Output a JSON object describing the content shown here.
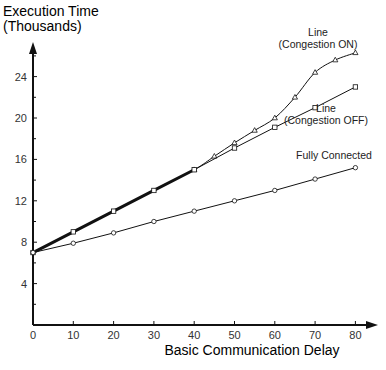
{
  "chart_data": {
    "type": "line",
    "title": "",
    "ylabel_line1": "Execution Time",
    "ylabel_line2": "(Thousands)",
    "xlabel": "Basic Communication Delay",
    "xlim": [
      0,
      80
    ],
    "ylim": [
      0,
      27
    ],
    "xticks": [
      0,
      10,
      20,
      30,
      40,
      50,
      60,
      70,
      80
    ],
    "yticks": [
      4,
      8,
      12,
      16,
      20,
      24
    ],
    "yticks_minor": [
      2,
      6,
      10,
      14,
      18,
      22,
      26
    ],
    "grid": false,
    "series": [
      {
        "name": "Line (Congestion ON)",
        "label_line1": "Line",
        "label_line2": "(Congestion ON)",
        "marker": "triangle",
        "x": [
          0,
          10,
          20,
          30,
          40,
          45,
          50,
          55,
          60,
          65,
          70,
          75,
          80
        ],
        "y": [
          7.0,
          9.0,
          11.0,
          13.0,
          15.0,
          16.3,
          17.6,
          18.8,
          20.0,
          22.0,
          24.4,
          25.6,
          26.3
        ]
      },
      {
        "name": "Line (Congestion OFF)",
        "label_line1": "Line",
        "label_line2": "(Congestion OFF)",
        "marker": "square",
        "x": [
          0,
          10,
          20,
          30,
          40,
          50,
          60,
          70,
          80
        ],
        "y": [
          7.0,
          9.0,
          11.0,
          13.0,
          15.0,
          17.1,
          19.1,
          21.0,
          23.0
        ]
      },
      {
        "name": "Fully Connected",
        "label_line1": "Fully Connected",
        "marker": "circle",
        "x": [
          0,
          10,
          20,
          30,
          40,
          50,
          60,
          70,
          80
        ],
        "y": [
          7.0,
          7.9,
          8.9,
          10.0,
          11.0,
          12.0,
          13.0,
          14.1,
          15.2
        ]
      }
    ]
  }
}
